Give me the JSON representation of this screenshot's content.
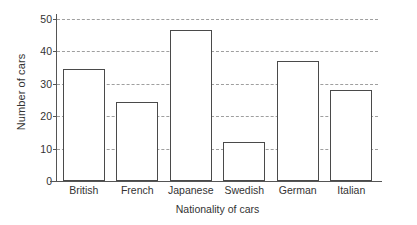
{
  "chart_data": {
    "type": "bar",
    "title": "",
    "xlabel": "Nationality of cars",
    "ylabel": "Number of cars",
    "categories": [
      "British",
      "French",
      "Japanese",
      "Swedish",
      "German",
      "Italian"
    ],
    "values": [
      34.5,
      24.5,
      46.5,
      12,
      37,
      28
    ],
    "ylim": [
      0,
      50
    ],
    "ytick_values": [
      0,
      10,
      20,
      30,
      40,
      50
    ],
    "ytick_labels": [
      "0",
      "10",
      "20",
      "30",
      "40",
      "50"
    ],
    "grid": true,
    "grid_axis": "y",
    "grid_style": "dashed",
    "legend": false,
    "bar_fill": "#ffffff",
    "bar_edge_color": "#4a4a4a",
    "grid_color": "#9a9a9a",
    "axis_color": "#555555",
    "background": "#ffffff"
  }
}
